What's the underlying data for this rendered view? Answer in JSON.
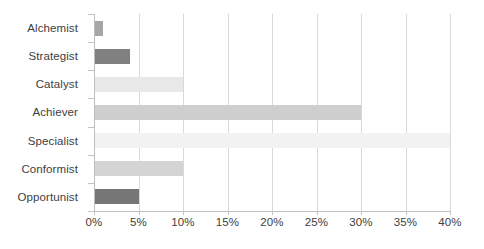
{
  "chart_data": {
    "type": "bar",
    "orientation": "horizontal",
    "title": "",
    "subtitle": "",
    "xlabel": "",
    "ylabel": "",
    "categories": [
      "Alchemist",
      "Strategist",
      "Catalyst",
      "Achiever",
      "Specialist",
      "Conformist",
      "Opportunist"
    ],
    "values": [
      1,
      4,
      10,
      30,
      40,
      10,
      5
    ],
    "value_suffix": "%",
    "xlim": [
      0,
      40
    ],
    "xticks": [
      0,
      5,
      10,
      15,
      20,
      25,
      30,
      35,
      40
    ],
    "xtick_labels": [
      "0%",
      "5%",
      "10%",
      "15%",
      "20%",
      "25%",
      "30%",
      "35%",
      "40%"
    ],
    "grid": "vertical",
    "legend": "none",
    "bar_colors": [
      "#a6a6a6",
      "#808080",
      "#e8e8e8",
      "#cfcfcf",
      "#f2f2f2",
      "#d4d4d4",
      "#767676"
    ],
    "gridline_color": "#d9d9d9",
    "axis_color": "#bfbfbf",
    "text_color": "#404040",
    "background_color": "#ffffff"
  }
}
